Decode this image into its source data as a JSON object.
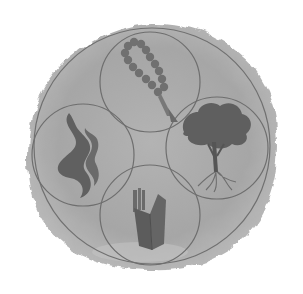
{
  "emblem": {
    "description": "Grayscale emblem: large circle containing four overlapping smaller circles, each with a symbol",
    "colors": {
      "background": "#ffffff",
      "blob": "#a9a9a9",
      "blob_light": "#b8b8b8",
      "circle_stroke": "#6e6e6e",
      "symbol": "#6a6a6a",
      "symbol_dark": "#5a5a5a"
    },
    "outer_circle": {
      "cx": 152,
      "cy": 146,
      "r": 118
    },
    "inner_circles": [
      {
        "position": "top",
        "symbol": "prayer-beads-icon",
        "cx": 150,
        "cy": 82,
        "r": 50
      },
      {
        "position": "left",
        "symbol": "flame-icon",
        "cx": 83,
        "cy": 155,
        "r": 51
      },
      {
        "position": "right",
        "symbol": "tree-icon",
        "cx": 217,
        "cy": 148,
        "r": 51
      },
      {
        "position": "bottom",
        "symbol": "book-icon",
        "cx": 150,
        "cy": 215,
        "r": 50
      }
    ]
  }
}
